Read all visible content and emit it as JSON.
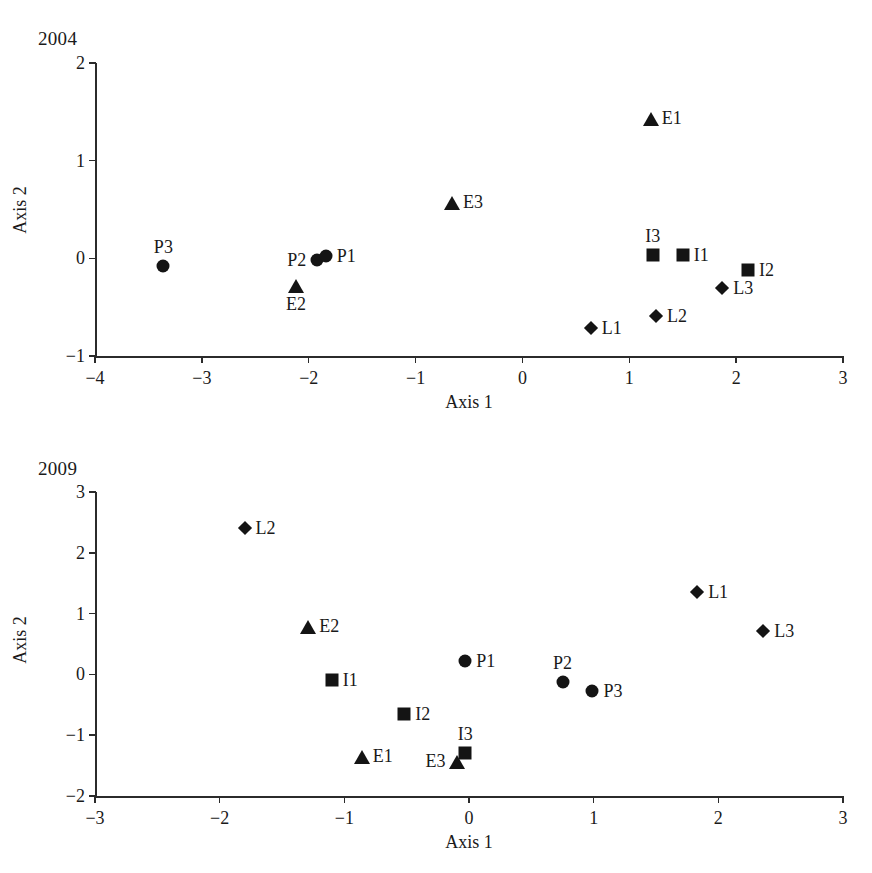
{
  "figure": {
    "axis_x_title": "Axis 1",
    "axis_y_title": "Axis 2",
    "marker_color": "#141414",
    "axis_color": "#2b2b2b",
    "background": "#ffffff"
  },
  "chart_data": [
    {
      "type": "scatter",
      "title": "2004",
      "xlabel": "Axis 1",
      "ylabel": "Axis 2",
      "xlim": [
        -4,
        3
      ],
      "ylim": [
        -1,
        2
      ],
      "xticks": [
        "-4",
        "-3",
        "-2",
        "-1",
        "0",
        "1",
        "2",
        "3"
      ],
      "xtick_values": [
        -4,
        -3,
        -2,
        -1,
        0,
        1,
        2,
        3
      ],
      "yticks": [
        "-1",
        "0",
        "1",
        "2"
      ],
      "ytick_values": [
        -1,
        0,
        1,
        2
      ],
      "grid": false,
      "legend": "none",
      "points": [
        {
          "label": "E1",
          "x": 1.2,
          "y": 1.44,
          "marker": "triangle",
          "group": "E",
          "label_pos": "right"
        },
        {
          "label": "E3",
          "x": -0.66,
          "y": 0.58,
          "marker": "triangle",
          "group": "E",
          "label_pos": "right"
        },
        {
          "label": "E2",
          "x": -2.12,
          "y": -0.27,
          "marker": "triangle",
          "group": "E",
          "label_pos": "below"
        },
        {
          "label": "P3",
          "x": -3.36,
          "y": -0.08,
          "marker": "circle",
          "group": "P",
          "label_pos": "above"
        },
        {
          "label": "P2",
          "x": -1.92,
          "y": -0.02,
          "marker": "circle",
          "group": "P",
          "label_pos": "left"
        },
        {
          "label": "P1",
          "x": -1.84,
          "y": 0.02,
          "marker": "circle",
          "group": "P",
          "label_pos": "right"
        },
        {
          "label": "I3",
          "x": 1.22,
          "y": 0.03,
          "marker": "square",
          "group": "I",
          "label_pos": "above"
        },
        {
          "label": "I1",
          "x": 1.5,
          "y": 0.03,
          "marker": "square",
          "group": "I",
          "label_pos": "right"
        },
        {
          "label": "I2",
          "x": 2.11,
          "y": -0.12,
          "marker": "square",
          "group": "I",
          "label_pos": "right"
        },
        {
          "label": "L3",
          "x": 1.87,
          "y": -0.3,
          "marker": "diamond",
          "group": "L",
          "label_pos": "right"
        },
        {
          "label": "L2",
          "x": 1.25,
          "y": -0.59,
          "marker": "diamond",
          "group": "L",
          "label_pos": "right"
        },
        {
          "label": "L1",
          "x": 0.64,
          "y": -0.71,
          "marker": "diamond",
          "group": "L",
          "label_pos": "right"
        }
      ]
    },
    {
      "type": "scatter",
      "title": "2009",
      "xlabel": "Axis 1",
      "ylabel": "Axis 2",
      "xlim": [
        -3,
        3
      ],
      "ylim": [
        -2,
        3
      ],
      "xticks": [
        "-3",
        "-2",
        "-1",
        "0",
        "1",
        "2",
        "3"
      ],
      "xtick_values": [
        -3,
        -2,
        -1,
        0,
        1,
        2,
        3
      ],
      "yticks": [
        "-2",
        "-1",
        "0",
        "1",
        "2",
        "3"
      ],
      "ytick_values": [
        -2,
        -1,
        0,
        1,
        2,
        3
      ],
      "grid": false,
      "legend": "none",
      "points": [
        {
          "label": "L2",
          "x": -1.8,
          "y": 2.4,
          "marker": "diamond",
          "group": "L",
          "label_pos": "right"
        },
        {
          "label": "L1",
          "x": 1.83,
          "y": 1.36,
          "marker": "diamond",
          "group": "L",
          "label_pos": "right"
        },
        {
          "label": "L3",
          "x": 2.36,
          "y": 0.71,
          "marker": "diamond",
          "group": "L",
          "label_pos": "right"
        },
        {
          "label": "E2",
          "x": -1.29,
          "y": 0.79,
          "marker": "triangle",
          "group": "E",
          "label_pos": "right"
        },
        {
          "label": "P1",
          "x": -0.03,
          "y": 0.22,
          "marker": "circle",
          "group": "P",
          "label_pos": "right"
        },
        {
          "label": "I1",
          "x": -1.1,
          "y": -0.09,
          "marker": "square",
          "group": "I",
          "label_pos": "right"
        },
        {
          "label": "P2",
          "x": 0.75,
          "y": -0.13,
          "marker": "circle",
          "group": "P",
          "label_pos": "above"
        },
        {
          "label": "P3",
          "x": 0.99,
          "y": -0.27,
          "marker": "circle",
          "group": "P",
          "label_pos": "right"
        },
        {
          "label": "I2",
          "x": -0.52,
          "y": -0.65,
          "marker": "square",
          "group": "I",
          "label_pos": "right"
        },
        {
          "label": "I3",
          "x": -0.03,
          "y": -1.3,
          "marker": "square",
          "group": "I",
          "label_pos": "above"
        },
        {
          "label": "E1",
          "x": -0.86,
          "y": -1.35,
          "marker": "triangle",
          "group": "E",
          "label_pos": "right"
        },
        {
          "label": "E3",
          "x": -0.1,
          "y": -1.42,
          "marker": "triangle",
          "group": "E",
          "label_pos": "left"
        }
      ]
    }
  ]
}
